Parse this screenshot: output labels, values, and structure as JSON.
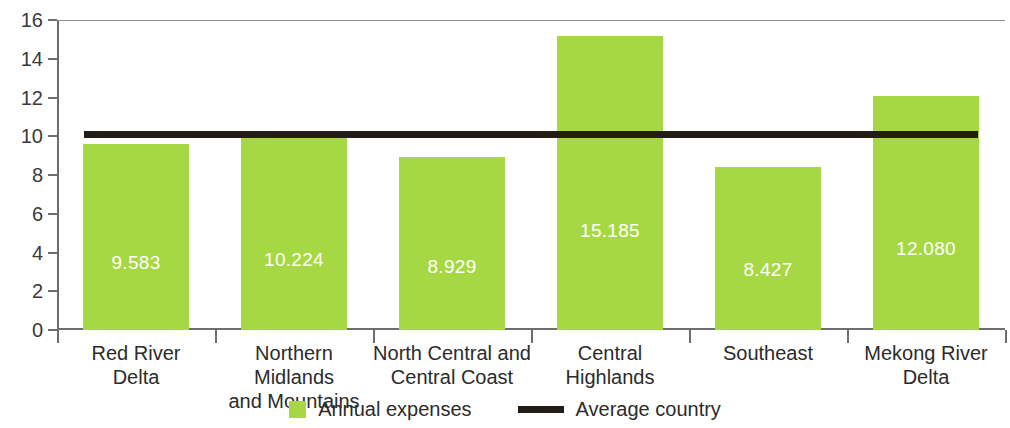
{
  "chart_data": {
    "type": "bar",
    "title": "",
    "subtitle": "",
    "xlabel": "",
    "ylabel": "",
    "ylim": [
      0,
      16
    ],
    "ytick_step": 2,
    "yticks": [
      "16",
      "14",
      "12",
      "10",
      "8",
      "6",
      "4",
      "2",
      "0"
    ],
    "grid": false,
    "legend_position": "bottom-center",
    "categories": [
      "Red River\nDelta",
      "Northern Midlands\nand Mountains",
      "North Central and\nCentral Coast",
      "Central\nHighlands",
      "Southeast",
      "Mekong River\nDelta"
    ],
    "category_lines": [
      [
        "Red River",
        "Delta"
      ],
      [
        "Northern Midlands",
        "and Mountains"
      ],
      [
        "North Central and",
        "Central Coast"
      ],
      [
        "Central",
        "Highlands"
      ],
      [
        "Southeast",
        ""
      ],
      [
        "Mekong River",
        "Delta"
      ]
    ],
    "series": [
      {
        "name": "Annual expenses",
        "type": "bar",
        "color": "#a6d843",
        "values": [
          9.583,
          10.224,
          8.929,
          15.185,
          8.427,
          12.08
        ],
        "labels": [
          "9.583",
          "10.224",
          "8.929",
          "15.185",
          "8.427",
          "12.080"
        ]
      },
      {
        "name": "Average country",
        "type": "line",
        "color": "#241c17",
        "value": 10.1
      }
    ]
  },
  "legend": {
    "items": [
      {
        "label": "Annual expenses",
        "marker": "square-swatch",
        "color": "#a6d843"
      },
      {
        "label": "Average country",
        "marker": "line-swatch",
        "color": "#241c17"
      }
    ]
  },
  "colors": {
    "bar_green": "#a6d843",
    "average_line": "#241c17",
    "axis": "#6e6e6e",
    "text": "#2b2b2b",
    "bar_label_text": "#ffffff",
    "background": "#ffffff"
  }
}
